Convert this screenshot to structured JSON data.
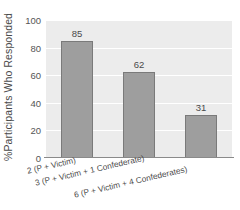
{
  "chart_data": {
    "type": "bar",
    "title": "",
    "xlabel": "",
    "ylabel": "%Participants Who Responded",
    "categories": [
      "2 (P + Victim)",
      "3 (P + Victim + 1 Confederate)",
      "6 (P + Victim + 4 Confederates)"
    ],
    "values": [
      85,
      62,
      31
    ],
    "value_labels": [
      "85",
      "62",
      "31"
    ],
    "ylim": [
      0,
      100
    ],
    "yticks": [
      0,
      20,
      40,
      60,
      80,
      100
    ],
    "ytick_labels": [
      "0",
      "20",
      "40",
      "60",
      "80",
      "100"
    ],
    "grid": true,
    "grid_axis": "y",
    "legend": false,
    "legend_position": "none",
    "bar_color": "#9e9e9e",
    "bar_edge_color": "#7a7a7a",
    "plot_background": "#ececec",
    "gridline_color": "#ffffff",
    "axis_line_color": "#8a8a8a",
    "text_color": "#4a4a4a"
  }
}
